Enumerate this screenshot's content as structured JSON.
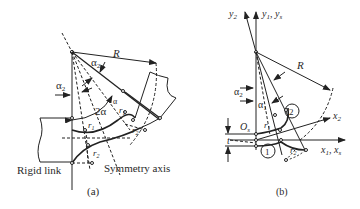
{
  "panel_a": {
    "caption": "(a)",
    "labels": {
      "R": "R",
      "alpha2_top": "α",
      "alpha2_top_sub": "2",
      "alpha2_left": "α",
      "alpha2_left_sub": "2",
      "two_alpha": "2α",
      "alpha": "α",
      "r1_a": "r",
      "r1_a_sub": "1",
      "r1_b": "r",
      "r1_b_sub": "1",
      "r2_a": "r",
      "r2_a_sub": "2",
      "r2_b": "r",
      "r2_b_sub": "2",
      "rigid_link": "Rigid link",
      "symmetry_axis": "Symmetry axis"
    }
  },
  "panel_b": {
    "caption": "(b)",
    "labels": {
      "y2": "y",
      "y2_sub": "2",
      "y1ys": "y",
      "y1ys_sub1": "1",
      "y1ys_sep": ", y",
      "y1ys_sub2": "s",
      "R": "R",
      "alpha2": "α",
      "alpha2_sub": "2",
      "alpha1": "α",
      "alpha1_sub": "1",
      "Os": "O",
      "Os_sub": "s",
      "t": "t",
      "r1": "r",
      "r1_sub": "1",
      "r2": "r",
      "r2_sub": "2",
      "x2": "x",
      "x2_sub": "2",
      "x1xs": "x",
      "x1xs_sub1": "1",
      "x1xs_sep": ", x",
      "x1xs_sub2": "s",
      "circle1": "1",
      "circle2": "2"
    }
  }
}
